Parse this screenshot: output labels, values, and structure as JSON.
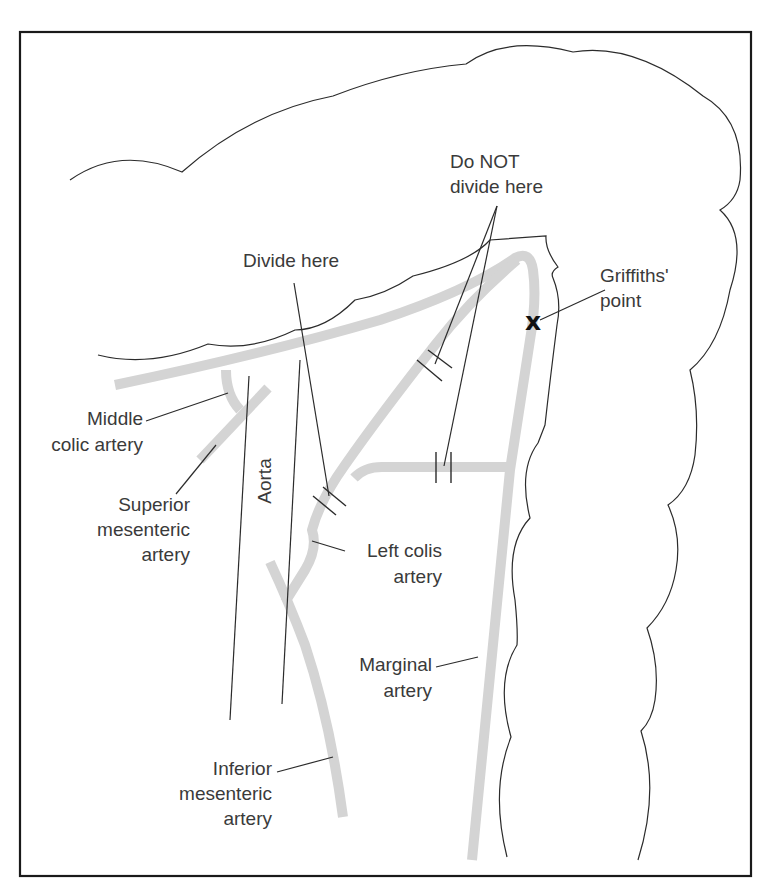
{
  "diagram": {
    "colors": {
      "artery": "#d4d4d4",
      "outline": "#2b2b2b",
      "frame": "#1a1a1a",
      "text": "#3a3a3a"
    },
    "labels": {
      "divide_here": "Divide here",
      "do_not": {
        "line1": "Do NOT",
        "line2": "divide here"
      },
      "griffiths": {
        "line1": "Griffiths'",
        "line2": "point",
        "marker": "x"
      },
      "middle_colic": {
        "line1": "Middle",
        "line2": "colic artery"
      },
      "superior_mesenteric": {
        "line1": "Superior",
        "line2": "mesenteric",
        "line3": "artery"
      },
      "aorta": "Aorta",
      "left_colis": {
        "line1": "Left colis",
        "line2": "artery"
      },
      "marginal": {
        "line1": "Marginal",
        "line2": "artery"
      },
      "inferior_mesenteric": {
        "line1": "Inferior",
        "line2": "mesenteric",
        "line3": "artery"
      }
    }
  }
}
